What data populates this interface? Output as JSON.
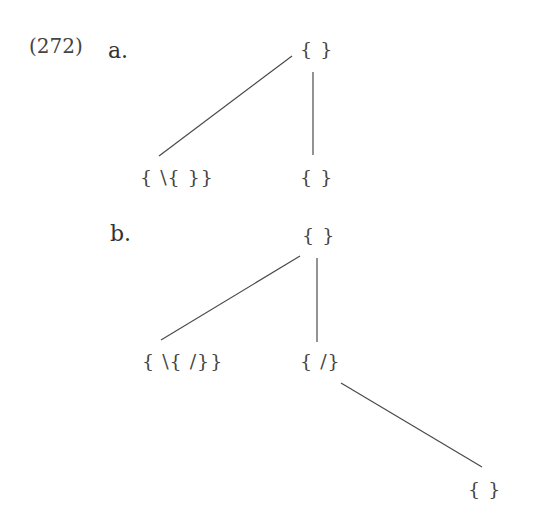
{
  "example": {
    "number": "(272)",
    "parts": [
      {
        "label": "a.",
        "nodes": [
          {
            "id": "a-root",
            "text": "{ }",
            "x": 300,
            "y": 40
          },
          {
            "id": "a-left",
            "text": "{ \\{ }}",
            "x": 140,
            "y": 168
          },
          {
            "id": "a-right",
            "text": "{ }",
            "x": 300,
            "y": 168
          }
        ],
        "edges": [
          {
            "from": "a-root",
            "to": "a-left",
            "x1": 292,
            "y1": 56,
            "x2": 159,
            "y2": 156
          },
          {
            "from": "a-root",
            "to": "a-right",
            "x1": 313,
            "y1": 72,
            "x2": 313,
            "y2": 155
          }
        ]
      },
      {
        "label": "b.",
        "nodes": [
          {
            "id": "b-root",
            "text": "{ }",
            "x": 302,
            "y": 226
          },
          {
            "id": "b-left",
            "text": "{ \\{ /}}",
            "x": 142,
            "y": 352
          },
          {
            "id": "b-mid",
            "text": "{ /}",
            "x": 300,
            "y": 352
          },
          {
            "id": "b-leaf",
            "text": "{ }",
            "x": 468,
            "y": 480
          }
        ],
        "edges": [
          {
            "from": "b-root",
            "to": "b-left",
            "x1": 300,
            "y1": 256,
            "x2": 161,
            "y2": 340
          },
          {
            "from": "b-root",
            "to": "b-mid",
            "x1": 317,
            "y1": 258,
            "x2": 317,
            "y2": 342
          },
          {
            "from": "b-mid",
            "to": "b-leaf",
            "x1": 341,
            "y1": 383,
            "x2": 482,
            "y2": 467
          }
        ]
      }
    ]
  }
}
